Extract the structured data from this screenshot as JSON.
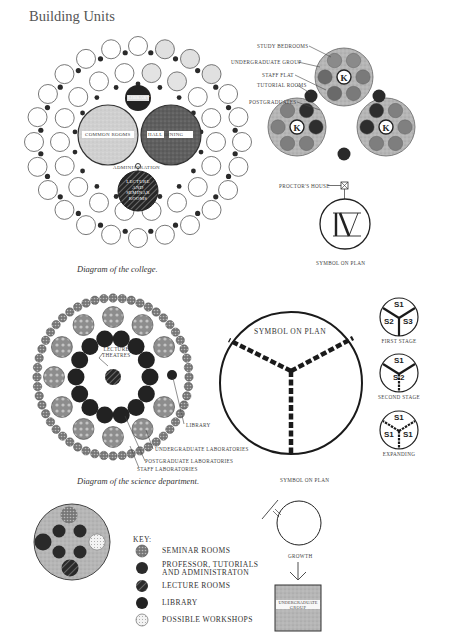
{
  "page": {
    "title": "Building Units"
  },
  "college_diagram": {
    "caption": "Diagram of the college.",
    "rooms": {
      "library": "LIBRARY",
      "common_rooms": "COMMON ROOMS",
      "hall_dining": "HALL DINING",
      "administration": "ADMINISTRATION",
      "lecture_seminar": [
        "LECTURE",
        "AND",
        "SEMINAR",
        "ROOMS"
      ]
    }
  },
  "building_unit": {
    "labels": {
      "study_bedrooms": "STUDY BEDROOMS",
      "undergraduate_group": "UNDERGRADUATE GROUP",
      "staff_flat": "STAFF FLAT",
      "tutorial_rooms": "TUTORIAL ROOMS",
      "postgraduates": "POSTGRADUATES"
    },
    "center_letter": "K",
    "proctors_house": "PROCTOR'S HOUSE",
    "symbol_caption": "SYMBOL ON PLAN"
  },
  "science_diagram": {
    "caption": "Diagram of the science department.",
    "labels": {
      "lecture_theatres": [
        "LECTURE",
        "THEATRES"
      ],
      "library": "LIBRARY",
      "undergraduate_laboratories": "UNDERGRADUATE LABORATORIES",
      "postgraduate_laboratories": "POSTGRADUATE LABORATORIES",
      "staff_laboratories": "STAFF LABORATORIES"
    }
  },
  "symbol_plan": {
    "inner_label": "SYMBOL ON PLAN",
    "caption": "SYMBOL ON PLAN"
  },
  "stages": [
    {
      "caption": "FIRST STAGE",
      "top": "S1",
      "left": "S2",
      "right": "S3"
    },
    {
      "caption": "SECOND STAGE",
      "top": "S1",
      "left": "S",
      "right": "2"
    },
    {
      "caption": "EXPANDING",
      "top": "S1",
      "left": "S1",
      "right": "S1"
    }
  ],
  "key": {
    "heading": "KEY:",
    "items": [
      {
        "label": "SEMINAR ROOMS",
        "pattern": "seminar"
      },
      {
        "label": "PROFESSOR, TUTORIALS",
        "label2": "AND ADMINISTRATON",
        "pattern": "professor"
      },
      {
        "label": "LECTURE ROOMS",
        "pattern": "lecture"
      },
      {
        "label": "LIBRARY",
        "pattern": "library"
      },
      {
        "label": "POSSIBLE WORKSHOPS",
        "pattern": "workshops"
      }
    ]
  },
  "growth": {
    "caption": "GROWTH",
    "box_label": [
      "UNDERGRADUATE",
      "GROUP"
    ]
  },
  "colors": {
    "ink": "#2b2b2b",
    "dark_fill": "#262626",
    "mid_grey": "#8a8a8a",
    "light_grey": "#c9c9c9",
    "pale_grey": "#dedede"
  }
}
